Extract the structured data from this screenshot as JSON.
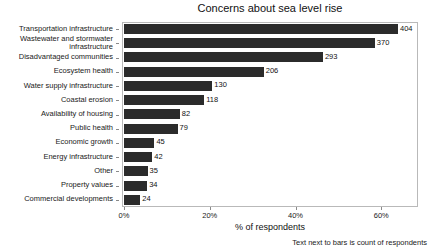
{
  "chart_data": {
    "type": "bar",
    "orientation": "horizontal",
    "title": "Concerns about sea level rise",
    "xlabel": "% of respondents",
    "ylabel": "",
    "caption": "Text next to bars is count of respondents",
    "grid": false,
    "legend": null,
    "xlim": [
      0,
      68.1
    ],
    "xticks": [
      0,
      20,
      40,
      60
    ],
    "xtick_labels": [
      "0%",
      "20%",
      "40%",
      "60%"
    ],
    "respondents_total": 632,
    "bar_color": "#2b2b2b",
    "categories": [
      "Transportation infrastructure",
      "Wastewater and stormwater infrastructure",
      "Disadvantaged communities",
      "Ecosystem health",
      "Water supply infrastructure",
      "Coastal erosion",
      "Availability of housing",
      "Public health",
      "Economic growth",
      "Energy infrastructure",
      "Other",
      "Property values",
      "Commercial developments"
    ],
    "values": [
      404,
      370,
      293,
      206,
      130,
      118,
      82,
      79,
      45,
      42,
      35,
      34,
      24
    ],
    "percent_values": [
      63.9,
      58.5,
      46.4,
      32.6,
      20.6,
      18.7,
      13.0,
      12.5,
      7.1,
      6.6,
      5.5,
      5.4,
      3.8
    ],
    "value_labels": [
      "404",
      "370",
      "293",
      "206",
      "130",
      "118",
      "82",
      "79",
      "45",
      "42",
      "35",
      "34",
      "24"
    ]
  }
}
